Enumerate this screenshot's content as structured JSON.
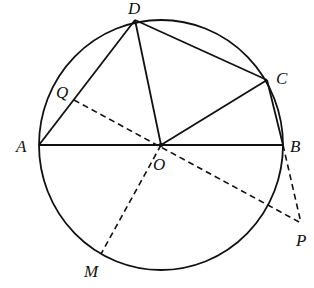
{
  "diagram": {
    "type": "geometry",
    "circle": {
      "center": "O",
      "cx": 161,
      "cy": 145,
      "rx": 122,
      "ry": 125
    },
    "points": {
      "A": {
        "x": 39,
        "y": 145,
        "label": "A",
        "lx": 16,
        "ly": 152
      },
      "B": {
        "x": 283,
        "y": 145,
        "label": "B",
        "lx": 290,
        "ly": 152
      },
      "O": {
        "x": 161,
        "y": 145,
        "label": "O",
        "lx": 153,
        "ly": 170
      },
      "D": {
        "x": 135,
        "y": 20,
        "label": "D",
        "lx": 128,
        "ly": 14
      },
      "C": {
        "x": 267,
        "y": 80,
        "label": "C",
        "lx": 276,
        "ly": 84
      },
      "Q": {
        "x": 74,
        "y": 100,
        "label": "Q",
        "lx": 56,
        "ly": 98
      },
      "P": {
        "x": 301,
        "y": 223,
        "label": "P",
        "lx": 296,
        "ly": 246
      },
      "M": {
        "x": 101,
        "y": 254,
        "label": "M",
        "lx": 84,
        "ly": 277
      }
    },
    "solid_segments": [
      [
        "A",
        "B"
      ],
      [
        "A",
        "D"
      ],
      [
        "D",
        "O"
      ],
      [
        "D",
        "C"
      ],
      [
        "C",
        "O"
      ],
      [
        "C",
        "B"
      ]
    ],
    "dashed_segments": [
      [
        "Q",
        "P"
      ],
      [
        "O",
        "M"
      ],
      [
        "B",
        "P"
      ]
    ],
    "stroke_color": "#111111"
  }
}
